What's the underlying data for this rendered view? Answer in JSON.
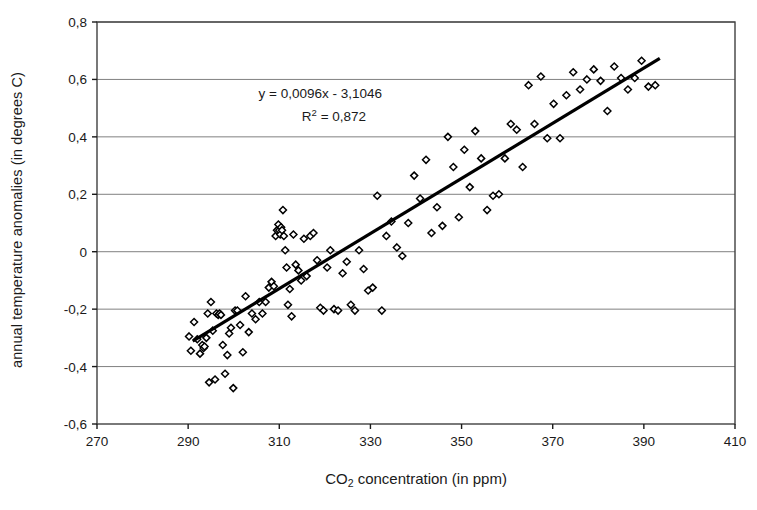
{
  "chart_data": {
    "type": "scatter",
    "title": "",
    "xlabel": "CO2 concentration (in ppm)",
    "xlabel_parts": {
      "pre": "CO",
      "sub": "2",
      "post": " concentration (in ppm)"
    },
    "ylabel": "annual temperature anomalies (in degrees C)",
    "xlim": [
      270,
      410
    ],
    "ylim": [
      -0.6,
      0.8
    ],
    "xticks": [
      270,
      290,
      310,
      330,
      350,
      370,
      390,
      410
    ],
    "xtick_labels": [
      "270",
      "290",
      "310",
      "330",
      "350",
      "370",
      "390",
      "410"
    ],
    "yticks": [
      -0.6,
      -0.4,
      -0.2,
      0,
      0.2,
      0.4,
      0.6,
      0.8
    ],
    "ytick_labels": [
      "-0,6",
      "-0,4",
      "-0,2",
      "0",
      "0,2",
      "0,4",
      "0,6",
      "0,8"
    ],
    "grid": {
      "horizontal": true,
      "vertical": false,
      "color": "#808080"
    },
    "legend": {
      "visible": false
    },
    "marker": {
      "shape": "diamond",
      "fill": "#ffffff",
      "edge": "#000000",
      "size": 7
    },
    "annotations": [
      {
        "name": "regression-equation",
        "text": "y = 0,0096x - 3,1046",
        "x": 319,
        "y": 0.535
      },
      {
        "name": "r-squared",
        "text_pre": "R",
        "text_sup": "2",
        "text_post": " = 0,872",
        "x": 322,
        "y": 0.455
      }
    ],
    "trendline": {
      "type": "linear",
      "equation": "y = 0,0096x - 3,1046",
      "slope": 0.0096,
      "intercept": -3.1046,
      "r_squared": 0.872,
      "x_start": 291,
      "x_end": 393.5,
      "color": "#000000",
      "width": 3.2
    },
    "series": [
      {
        "name": "annual temperature anomaly vs CO2",
        "points": [
          [
            290.2,
            -0.295
          ],
          [
            290.6,
            -0.345
          ],
          [
            291.3,
            -0.245
          ],
          [
            292.0,
            -0.305
          ],
          [
            292.6,
            -0.355
          ],
          [
            293.1,
            -0.325
          ],
          [
            293.4,
            -0.335
          ],
          [
            293.6,
            -0.33
          ],
          [
            294.0,
            -0.3
          ],
          [
            294.3,
            -0.215
          ],
          [
            294.6,
            -0.455
          ],
          [
            295.0,
            -0.175
          ],
          [
            295.4,
            -0.275
          ],
          [
            295.9,
            -0.445
          ],
          [
            296.2,
            -0.215
          ],
          [
            296.6,
            -0.22
          ],
          [
            296.9,
            -0.215
          ],
          [
            297.2,
            -0.22
          ],
          [
            297.6,
            -0.325
          ],
          [
            298.1,
            -0.425
          ],
          [
            298.6,
            -0.36
          ],
          [
            299.0,
            -0.285
          ],
          [
            299.4,
            -0.265
          ],
          [
            299.9,
            -0.475
          ],
          [
            300.3,
            -0.205
          ],
          [
            300.8,
            -0.205
          ],
          [
            301.4,
            -0.255
          ],
          [
            302.0,
            -0.35
          ],
          [
            302.6,
            -0.155
          ],
          [
            303.3,
            -0.28
          ],
          [
            304.0,
            -0.215
          ],
          [
            304.8,
            -0.235
          ],
          [
            305.6,
            -0.175
          ],
          [
            306.3,
            -0.215
          ],
          [
            307.0,
            -0.175
          ],
          [
            307.7,
            -0.125
          ],
          [
            308.3,
            -0.105
          ],
          [
            308.8,
            -0.12
          ],
          [
            309.2,
            0.055
          ],
          [
            309.5,
            0.075
          ],
          [
            309.8,
            0.095
          ],
          [
            310.0,
            0.075
          ],
          [
            310.2,
            0.06
          ],
          [
            310.4,
            0.085
          ],
          [
            310.6,
            0.075
          ],
          [
            310.8,
            0.145
          ],
          [
            311.0,
            0.055
          ],
          [
            311.3,
            0.005
          ],
          [
            311.6,
            -0.055
          ],
          [
            311.9,
            -0.185
          ],
          [
            312.3,
            -0.13
          ],
          [
            312.7,
            -0.225
          ],
          [
            313.1,
            0.06
          ],
          [
            313.6,
            -0.045
          ],
          [
            314.2,
            -0.065
          ],
          [
            314.8,
            -0.1
          ],
          [
            315.4,
            0.045
          ],
          [
            316.0,
            -0.085
          ],
          [
            316.8,
            0.055
          ],
          [
            317.5,
            0.065
          ],
          [
            318.3,
            -0.03
          ],
          [
            319.0,
            -0.195
          ],
          [
            319.7,
            -0.205
          ],
          [
            320.5,
            -0.055
          ],
          [
            321.2,
            0.005
          ],
          [
            322.0,
            -0.2
          ],
          [
            322.9,
            -0.205
          ],
          [
            323.9,
            -0.075
          ],
          [
            324.8,
            -0.035
          ],
          [
            325.7,
            -0.185
          ],
          [
            326.6,
            -0.205
          ],
          [
            327.5,
            0.005
          ],
          [
            328.5,
            -0.06
          ],
          [
            329.5,
            -0.135
          ],
          [
            330.5,
            -0.125
          ],
          [
            331.5,
            0.195
          ],
          [
            332.5,
            -0.205
          ],
          [
            333.5,
            0.055
          ],
          [
            334.6,
            0.105
          ],
          [
            335.8,
            0.015
          ],
          [
            337.0,
            -0.015
          ],
          [
            338.3,
            0.1
          ],
          [
            339.6,
            0.265
          ],
          [
            340.9,
            0.185
          ],
          [
            342.2,
            0.32
          ],
          [
            343.4,
            0.065
          ],
          [
            344.6,
            0.155
          ],
          [
            345.8,
            0.09
          ],
          [
            347.0,
            0.4
          ],
          [
            348.2,
            0.295
          ],
          [
            349.4,
            0.12
          ],
          [
            350.6,
            0.355
          ],
          [
            351.8,
            0.225
          ],
          [
            353.0,
            0.42
          ],
          [
            354.3,
            0.325
          ],
          [
            355.6,
            0.145
          ],
          [
            356.9,
            0.195
          ],
          [
            358.2,
            0.2
          ],
          [
            359.5,
            0.325
          ],
          [
            360.8,
            0.445
          ],
          [
            362.1,
            0.425
          ],
          [
            363.4,
            0.295
          ],
          [
            364.7,
            0.58
          ],
          [
            366.0,
            0.445
          ],
          [
            367.4,
            0.61
          ],
          [
            368.8,
            0.395
          ],
          [
            370.2,
            0.515
          ],
          [
            371.6,
            0.395
          ],
          [
            373.0,
            0.545
          ],
          [
            374.5,
            0.625
          ],
          [
            376.0,
            0.565
          ],
          [
            377.5,
            0.6
          ],
          [
            379.0,
            0.635
          ],
          [
            380.5,
            0.595
          ],
          [
            382.0,
            0.49
          ],
          [
            383.5,
            0.645
          ],
          [
            385.0,
            0.605
          ],
          [
            386.5,
            0.565
          ],
          [
            388.0,
            0.605
          ],
          [
            389.5,
            0.665
          ],
          [
            391.0,
            0.575
          ],
          [
            392.5,
            0.58
          ]
        ]
      }
    ]
  }
}
